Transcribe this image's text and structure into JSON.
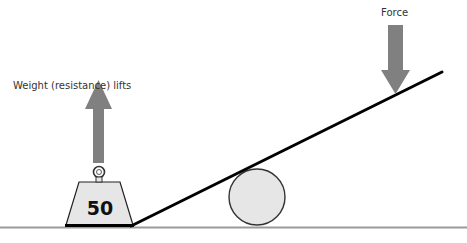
{
  "diagram": {
    "labels": {
      "weight_label": "Weight (resistance) lifts",
      "force_label": "Force",
      "weight_value": "50"
    },
    "colors": {
      "arrow": "#808080",
      "line": "#000000",
      "ground": "#9a9a9a",
      "fill_light": "#e6e6e6"
    },
    "elements": [
      {
        "id": "ground-line",
        "type": "line"
      },
      {
        "id": "lever-bar",
        "type": "line"
      },
      {
        "id": "fulcrum-circle",
        "type": "circle"
      },
      {
        "id": "weight-block",
        "type": "trapezoid",
        "value": "50"
      },
      {
        "id": "weight-up-arrow",
        "type": "arrow",
        "direction": "up"
      },
      {
        "id": "force-down-arrow",
        "type": "arrow",
        "direction": "down"
      }
    ]
  }
}
